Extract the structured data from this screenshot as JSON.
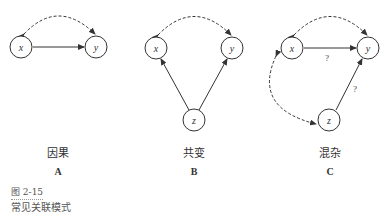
{
  "panels": [
    {
      "id": "A",
      "title": "因果",
      "letter": "A",
      "nodes": {
        "x": "x",
        "y": "y"
      }
    },
    {
      "id": "B",
      "title": "共变",
      "letter": "B",
      "nodes": {
        "x": "x",
        "y": "y",
        "z": "z"
      }
    },
    {
      "id": "C",
      "title": "混杂",
      "letter": "C",
      "nodes": {
        "x": "x",
        "y": "y",
        "z": "z"
      },
      "edge_labels": {
        "xy": "?",
        "zy": "?"
      }
    }
  ],
  "figure": {
    "number": "图 2-15",
    "caption": "常见关联模式"
  },
  "colors": {
    "stroke": "#333333",
    "text": "#333333",
    "caption": "#555555"
  }
}
